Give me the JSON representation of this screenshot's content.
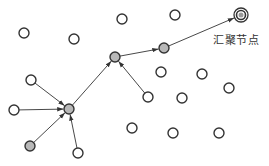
{
  "diagram": {
    "type": "wireless-sensor-network-routing",
    "sink_label": "汇聚节点",
    "sink": {
      "id": "sink",
      "x": 241,
      "y": 15
    },
    "nodes": [
      {
        "id": "n1",
        "x": 24,
        "y": 33,
        "kind": "idle"
      },
      {
        "id": "n2",
        "x": 74,
        "y": 39,
        "kind": "idle"
      },
      {
        "id": "n3",
        "x": 122,
        "y": 19,
        "kind": "idle"
      },
      {
        "id": "n4",
        "x": 175,
        "y": 15,
        "kind": "idle"
      },
      {
        "id": "n5",
        "x": 31,
        "y": 80,
        "kind": "source"
      },
      {
        "id": "n6",
        "x": 14,
        "y": 110,
        "kind": "source"
      },
      {
        "id": "n7",
        "x": 30,
        "y": 146,
        "kind": "source-gray"
      },
      {
        "id": "n8",
        "x": 78,
        "y": 153,
        "kind": "source"
      },
      {
        "id": "n9",
        "x": 148,
        "y": 97,
        "kind": "source"
      },
      {
        "id": "n10",
        "x": 161,
        "y": 72,
        "kind": "idle"
      },
      {
        "id": "n11",
        "x": 202,
        "y": 74,
        "kind": "idle"
      },
      {
        "id": "n12",
        "x": 229,
        "y": 88,
        "kind": "idle"
      },
      {
        "id": "n13",
        "x": 182,
        "y": 98,
        "kind": "idle"
      },
      {
        "id": "n14",
        "x": 132,
        "y": 128,
        "kind": "idle"
      },
      {
        "id": "n15",
        "x": 173,
        "y": 133,
        "kind": "idle"
      },
      {
        "id": "n16",
        "x": 219,
        "y": 133,
        "kind": "idle"
      },
      {
        "id": "r1",
        "x": 69,
        "y": 109,
        "kind": "relay"
      },
      {
        "id": "r2",
        "x": 115,
        "y": 57,
        "kind": "relay"
      },
      {
        "id": "r3",
        "x": 164,
        "y": 48,
        "kind": "relay"
      }
    ],
    "edges": [
      {
        "from": "n5",
        "to": "r1"
      },
      {
        "from": "n6",
        "to": "r1"
      },
      {
        "from": "n7",
        "to": "r1"
      },
      {
        "from": "n8",
        "to": "r1"
      },
      {
        "from": "r1",
        "to": "r2"
      },
      {
        "from": "n9",
        "to": "r2"
      },
      {
        "from": "r2",
        "to": "r3"
      },
      {
        "from": "r3",
        "to": "sink"
      }
    ],
    "colors": {
      "stroke": "#333333",
      "relay_fill": "#b8b8b8",
      "idle_fill": "#ffffff"
    }
  }
}
